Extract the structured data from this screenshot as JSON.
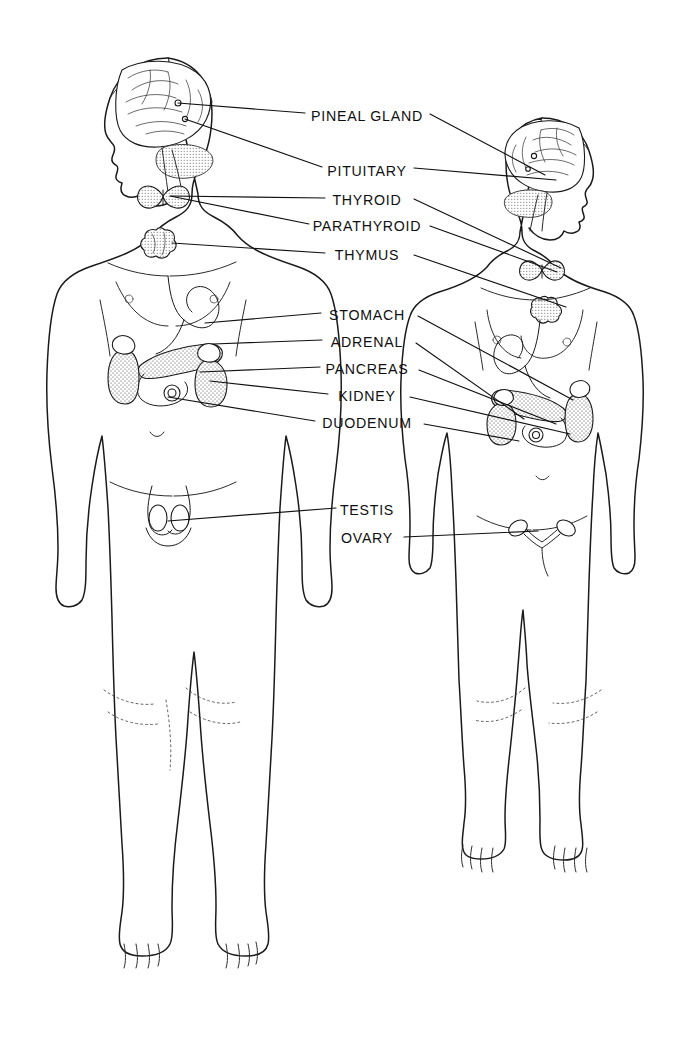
{
  "diagram": {
    "background_color": "#ffffff",
    "ink_color": "#111111",
    "figures": [
      {
        "name": "male-figure",
        "sex": "male",
        "facing": "viewer, head turned left"
      },
      {
        "name": "female-figure",
        "sex": "female",
        "facing": "viewer, head turned right"
      }
    ]
  },
  "labels": [
    {
      "id": "pineal-gland",
      "text": "PINEAL GLAND",
      "x": 367,
      "y": 116
    },
    {
      "id": "pituitary",
      "text": "PITUITARY",
      "x": 367,
      "y": 171
    },
    {
      "id": "thyroid",
      "text": "THYROID",
      "x": 367,
      "y": 200
    },
    {
      "id": "parathyroid",
      "text": "PARATHYROID",
      "x": 367,
      "y": 226
    },
    {
      "id": "thymus",
      "text": "THYMUS",
      "x": 367,
      "y": 255
    },
    {
      "id": "stomach",
      "text": "STOMACH",
      "x": 367,
      "y": 315
    },
    {
      "id": "adrenal",
      "text": "ADRENAL",
      "x": 367,
      "y": 342
    },
    {
      "id": "pancreas",
      "text": "PANCREAS",
      "x": 367,
      "y": 369
    },
    {
      "id": "kidney",
      "text": "KIDNEY",
      "x": 367,
      "y": 396
    },
    {
      "id": "duodenum",
      "text": "DUODENUM",
      "x": 367,
      "y": 423
    },
    {
      "id": "testis",
      "text": "TESTIS",
      "x": 367,
      "y": 510
    },
    {
      "id": "ovary",
      "text": "OVARY",
      "x": 367,
      "y": 538
    }
  ],
  "leader_lines": [
    {
      "label": "pineal-gland",
      "side": "left",
      "path": "M305,113 L178,103"
    },
    {
      "label": "pineal-gland",
      "side": "right",
      "path": "M430,114 L545,175"
    },
    {
      "label": "pituitary",
      "side": "left",
      "path": "M322,167 L185,119"
    },
    {
      "label": "pituitary",
      "side": "right",
      "path": "M414,168 L556,180"
    },
    {
      "label": "thyroid",
      "side": "left",
      "path": "M325,198 L171,196"
    },
    {
      "label": "thyroid",
      "side": "right",
      "path": "M414,199 L561,268"
    },
    {
      "label": "parathyroid",
      "side": "left",
      "path": "M309,224 L170,196"
    },
    {
      "label": "parathyroid",
      "side": "right",
      "path": "M430,226 L557,272"
    },
    {
      "label": "thymus",
      "side": "left",
      "path": "M325,253 L172,243"
    },
    {
      "label": "thymus",
      "side": "right",
      "path": "M414,255 L566,307"
    },
    {
      "label": "stomach",
      "side": "left",
      "path": "M321,313 L205,323"
    },
    {
      "label": "stomach",
      "side": "right",
      "path": "M418,316 L573,400"
    },
    {
      "label": "adrenal",
      "side": "left",
      "path": "M322,340 L213,344"
    },
    {
      "label": "adrenal",
      "side": "right",
      "path": "M416,343 L524,419"
    },
    {
      "label": "pancreas",
      "side": "left",
      "path": "M320,367 L200,372"
    },
    {
      "label": "pancreas",
      "side": "right",
      "path": "M419,370 L556,424"
    },
    {
      "label": "kidney",
      "side": "left",
      "path": "M328,394 L210,381"
    },
    {
      "label": "kidney",
      "side": "right",
      "path": "M410,397 L570,434"
    },
    {
      "label": "duodenum",
      "side": "left",
      "path": "M315,421 L168,397"
    },
    {
      "label": "duodenum",
      "side": "right",
      "path": "M424,424 L519,441"
    },
    {
      "label": "testis",
      "side": "left",
      "path": "M336,508 L168,521"
    },
    {
      "label": "ovary",
      "side": "right",
      "path": "M404,537 L538,531"
    }
  ],
  "organs": [
    {
      "name": "brain",
      "figure": "male",
      "note": "cerebrum with sulci, cerebellum stippled"
    },
    {
      "name": "pineal",
      "figure": "male",
      "note": "small dot deep in brain"
    },
    {
      "name": "pituitary",
      "figure": "male",
      "note": "small gland below brain base"
    },
    {
      "name": "thyroid",
      "figure": "male",
      "note": "butterfly-shaped, stippled, at neck base"
    },
    {
      "name": "thymus",
      "figure": "male",
      "note": "lobed, stippled, upper chest"
    },
    {
      "name": "stomach",
      "figure": "male",
      "note": "J-shaped outline upper abdomen"
    },
    {
      "name": "pancreas",
      "figure": "male",
      "note": "elongated stippled organ"
    },
    {
      "name": "duodenum",
      "figure": "male",
      "note": "C-loop around pancreas head"
    },
    {
      "name": "kidney-left",
      "figure": "male",
      "note": "bean-shaped, stippled"
    },
    {
      "name": "kidney-right",
      "figure": "male",
      "note": "bean-shaped, stippled"
    },
    {
      "name": "adrenal-left",
      "figure": "male",
      "note": "cap atop left kidney"
    },
    {
      "name": "adrenal-right",
      "figure": "male",
      "note": "cap atop right kidney"
    },
    {
      "name": "testes",
      "figure": "male",
      "note": "paired ovals in scrotum"
    },
    {
      "name": "brain",
      "figure": "female",
      "note": "mirrored cerebrum and cerebellum"
    },
    {
      "name": "thyroid",
      "figure": "female",
      "note": "butterfly-shaped at neck base"
    },
    {
      "name": "thymus",
      "figure": "female",
      "note": "lobed gland upper chest"
    },
    {
      "name": "stomach",
      "figure": "female",
      "note": "mirrored J-shaped outline"
    },
    {
      "name": "pancreas",
      "figure": "female",
      "note": "mirrored elongated organ"
    },
    {
      "name": "kidneys",
      "figure": "female",
      "note": "paired bean shapes"
    },
    {
      "name": "adrenals",
      "figure": "female",
      "note": "paired caps atop kidneys"
    },
    {
      "name": "ovaries",
      "figure": "female",
      "note": "paired ovals with fallopian tubes and uterus"
    }
  ]
}
